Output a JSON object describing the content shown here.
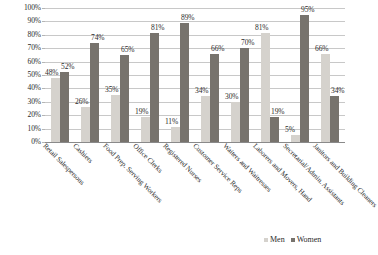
{
  "chart_data": {
    "type": "bar",
    "title": "",
    "subtitle": "",
    "xlabel": "",
    "ylabel": "",
    "ylim": [
      0,
      100
    ],
    "ytick_labels": [
      "100%",
      "90%",
      "80%",
      "70%",
      "60%",
      "50%",
      "40%",
      "30%",
      "20%",
      "10%",
      "0%"
    ],
    "ytick_values": [
      100,
      90,
      80,
      70,
      60,
      50,
      40,
      30,
      20,
      10,
      0
    ],
    "grid": true,
    "legend_position": "bottom-right",
    "categories": [
      "Retail Salespersons",
      "Cashiers",
      "Food Prep. Serving Workers",
      "Office Clerks",
      "Registered Nurses",
      "Customer Service Reps",
      "Waiters and Waitresses",
      "Laborers and Movers, Hand",
      "Secretarial/Admin. Assistants",
      "Janitors and Building Cleaners"
    ],
    "series": [
      {
        "name": "Men",
        "color": "#d5d2cd",
        "values": [
          48,
          26,
          35,
          19,
          11,
          34,
          30,
          81,
          5,
          66
        ],
        "labels": [
          "48%",
          "26%",
          "35%",
          "19%",
          "11%",
          "34%",
          "30%",
          "81%",
          "5%",
          "66%"
        ]
      },
      {
        "name": "Women",
        "color": "#77736d",
        "values": [
          52,
          74,
          65,
          81,
          89,
          66,
          70,
          19,
          95,
          34
        ],
        "labels": [
          "52%",
          "74%",
          "65%",
          "81%",
          "89%",
          "66%",
          "70%",
          "19%",
          "95%",
          "34%"
        ]
      }
    ]
  },
  "legend": {
    "items": [
      {
        "label": "Men"
      },
      {
        "label": "Women"
      }
    ]
  }
}
